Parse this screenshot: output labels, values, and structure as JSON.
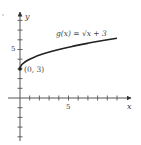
{
  "chart_data": {
    "type": "line",
    "title": "",
    "function_label": "g(x) = √x + 3",
    "xlabel": "x",
    "ylabel": "y",
    "x_tick_label": "5",
    "y_tick_label": "5",
    "xlim": [
      -1.2,
      11.5
    ],
    "ylim": [
      -4.4,
      8.8
    ],
    "grid": false,
    "legend": "none",
    "annotations": [
      {
        "text": "(0, 3)",
        "x": 0,
        "y": 3,
        "marker": "filled-dot"
      }
    ],
    "series": [
      {
        "name": "g(x) = √x + 3",
        "x": [
          0,
          0.25,
          0.5,
          1,
          2,
          3,
          4,
          5,
          6,
          7,
          8,
          9,
          10
        ],
        "y": [
          3,
          3.5,
          3.71,
          4,
          4.41,
          4.73,
          5,
          5.24,
          5.45,
          5.65,
          5.83,
          6,
          6.16
        ]
      }
    ],
    "x_ticks": [
      1,
      2,
      3,
      4,
      5,
      6,
      7,
      8,
      9,
      10
    ],
    "y_ticks": [
      -4,
      -3,
      -2,
      -1,
      1,
      2,
      3,
      4,
      5,
      6,
      7,
      8
    ],
    "colors": {
      "curve": "#222222",
      "axes": "#555555",
      "text": "#444444",
      "background": "#ffffff"
    }
  }
}
